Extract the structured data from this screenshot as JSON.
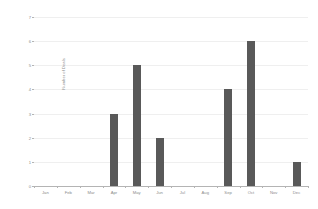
{
  "chart_data": {
    "type": "bar",
    "title": "",
    "subtitle": "",
    "xlabel": "",
    "ylabel": "Number of Deals",
    "categories": [
      "Jan",
      "Feb",
      "Mar",
      "Apr",
      "May",
      "Jun",
      "Jul",
      "Aug",
      "Sep",
      "Oct",
      "Nov",
      "Dec"
    ],
    "values": [
      0,
      0,
      0,
      3,
      5,
      2,
      0,
      0,
      4,
      6,
      0,
      1
    ],
    "ylim": [
      0,
      7
    ],
    "ytick_labels": [
      "0",
      "1",
      "2",
      "3",
      "4",
      "5",
      "6",
      "7"
    ],
    "ytick_values": [
      0,
      1,
      2,
      3,
      4,
      5,
      6,
      7
    ],
    "grid": true,
    "grid_axis": "y",
    "legend": false,
    "legend_position": "none",
    "bar_color": "#595959",
    "gridline_color": "#efefef",
    "axis_color": "#b4b4b4",
    "tick_label_color": "#8c8c8c",
    "background_color": "#ffffff"
  }
}
